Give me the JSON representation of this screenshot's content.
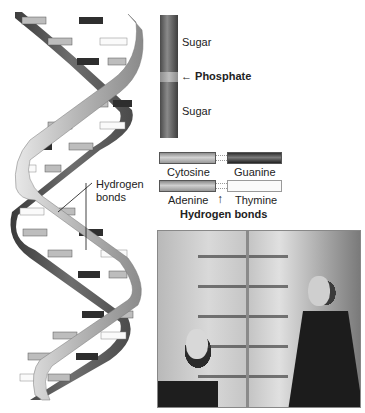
{
  "figure": {
    "helix_callout": {
      "line1": "Hydrogen",
      "line2": "bonds"
    },
    "backbone": {
      "sugar_top": "Sugar",
      "phosphate": "Phosphate",
      "phosphate_arrow": "←",
      "sugar_bottom": "Sugar"
    },
    "base_pairs": {
      "pair1": {
        "left": "Cytosine",
        "right": "Guanine"
      },
      "pair2": {
        "left": "Adenine",
        "right": "Thymine"
      },
      "arrow": "↑",
      "bonds_label": "Hydrogen bonds"
    },
    "photo": {
      "description": "Black-and-white photograph of two men beside a DNA double-helix model"
    },
    "colors": {
      "cytosine": "#b0b0b0",
      "guanine": "#333333",
      "adenine": "#b0b0b0",
      "thymine": "#fafafa",
      "backbone": "#6a6a6a"
    }
  }
}
